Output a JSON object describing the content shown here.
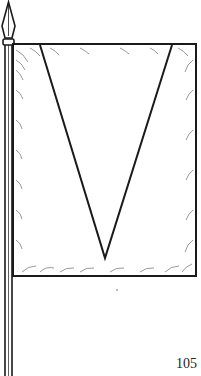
{
  "illustration": {
    "subject": "flag-on-pole",
    "charge": "pile (inverted V)",
    "colors": {
      "line": "#1a1a1a",
      "field": "#ffffff"
    }
  },
  "page": {
    "number": "105"
  }
}
